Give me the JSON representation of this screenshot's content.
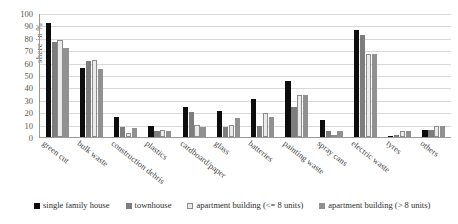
{
  "chart_data": {
    "type": "bar",
    "title": "",
    "xlabel": "",
    "ylabel": "share in %",
    "ylim": [
      0,
      100
    ],
    "ytick_values": [
      0,
      10,
      20,
      30,
      40,
      50,
      60,
      70,
      80,
      90,
      100
    ],
    "ytick_labels": [
      "0",
      "10",
      "20",
      "30",
      "40",
      "50",
      "60",
      "70",
      "80",
      "90",
      "100"
    ],
    "grid": true,
    "legend_position": "bottom",
    "categories": [
      "green cut",
      "bulk waste",
      "construction debris",
      "plastics",
      "cardboard/paper",
      "glass",
      "batteries",
      "painting waste",
      "spray cans",
      "electric waste",
      "tyres",
      "others"
    ],
    "series": [
      {
        "name": "single family house",
        "color": "#0d0d0d",
        "values": [
          92,
          56,
          16,
          9,
          24,
          21,
          31,
          45,
          14,
          86,
          1,
          6
        ]
      },
      {
        "name": "townhouse",
        "color": "#7d7d7d",
        "values": [
          77,
          61,
          8,
          5,
          20,
          8,
          9,
          24,
          5,
          82,
          2,
          6
        ]
      },
      {
        "name": "apartment building (<= 8 units)",
        "color": "#ebebeb",
        "values": [
          78,
          62,
          3,
          6,
          10,
          10,
          19,
          34,
          1,
          67,
          5,
          9
        ]
      },
      {
        "name": "apartment building (> 8 units)",
        "color": "#919191",
        "values": [
          72,
          55,
          7,
          5,
          8,
          15,
          16,
          34,
          5,
          67,
          5,
          9
        ]
      }
    ]
  }
}
